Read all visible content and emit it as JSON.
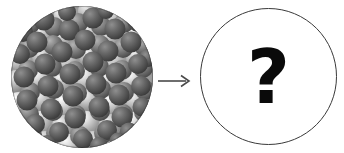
{
  "figure": {
    "type": "process-diagram",
    "background_color": "#ffffff",
    "width": 344,
    "height": 153
  },
  "left_panel": {
    "name": "packed-sphere-sample",
    "description": "Circular grayscale space-filling molecular model of densely packed spheres",
    "shape": "circle",
    "fill_style": "packed-spheres-texture",
    "sphere_dark_color": "#5a5a5a",
    "sphere_mid_color": "#8a8a8a",
    "sphere_light_color": "#e8e8e8",
    "background_color": "#9a9a9a",
    "outline_color": "#2b2b2b",
    "sphere_count": 118,
    "label": ""
  },
  "arrow": {
    "name": "transformation-arrow",
    "direction": "right",
    "color": "#4a4a4a",
    "label": ""
  },
  "right_panel": {
    "name": "unknown-result",
    "shape": "circle",
    "fill_color": "#ffffff",
    "outline_color": "#3a3a3a",
    "symbol": "?",
    "symbol_color": "#0a0a0a",
    "label": ""
  }
}
